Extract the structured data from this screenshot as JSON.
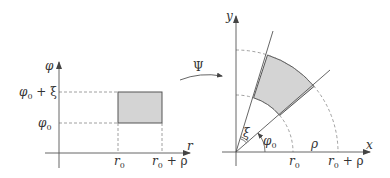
{
  "left_panel": {
    "vertical_axis_label": "φ",
    "horizontal_axis_label": "r",
    "y_tick_upper": {
      "base": "φ",
      "sub": "0",
      "rest": " + ξ"
    },
    "y_tick_lower": {
      "base": "φ",
      "sub": "0"
    },
    "x_tick_left": {
      "base": "r",
      "sub": "0"
    },
    "x_tick_right": {
      "base": "r",
      "sub": "0",
      "rest": " + ρ"
    },
    "region": "rectangle [r0, r0+ρ] × [φ0, φ0+ξ]"
  },
  "mapping": {
    "label": "Ψ"
  },
  "right_panel": {
    "vertical_axis_label": "y",
    "horizontal_axis_label": "x",
    "angle_start_label": {
      "base": "φ",
      "sub": "0"
    },
    "angle_width_label": "ξ",
    "radial_width_label": "ρ",
    "x_tick_left": {
      "base": "r",
      "sub": "0"
    },
    "x_tick_right": {
      "base": "r",
      "sub": "0",
      "rest": " + ρ"
    },
    "region": "annular sector"
  },
  "colors": {
    "region_fill": "#d4d4d4",
    "line": "#555555",
    "dashed": "#888888"
  }
}
